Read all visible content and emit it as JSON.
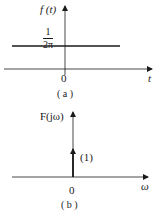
{
  "figure_a": {
    "ylabel": "f (t)",
    "level_numerator": "1",
    "level_denominator": "2π",
    "origin": "0",
    "xlabel": "t",
    "caption": "( a )"
  },
  "figure_b": {
    "ylabel": "F(jω)",
    "impulse_weight": "(1)",
    "origin": "0",
    "xlabel": "ω",
    "caption": "( b )"
  },
  "colors": {
    "ink": "#1a1a1a",
    "background": "#ffffff"
  }
}
